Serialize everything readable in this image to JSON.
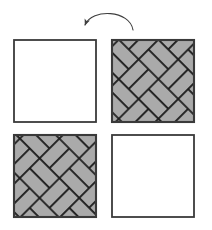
{
  "figure": {
    "canvas": {
      "width": 212,
      "height": 230,
      "background": "#ffffff"
    },
    "colors": {
      "outline": "#3a3a3a",
      "tile_fill": "#aaaaaa",
      "tile_outline": "#1a1a1a",
      "empty_fill": "#ffffff",
      "arrow": "#3f3f3f"
    },
    "arrow": {
      "name": "rotation-arrow",
      "direction": "counterclockwise",
      "label": "",
      "start_x": 132,
      "start_y": 28,
      "end_x": 84,
      "end_y": 26,
      "arrowhead_at": "left-end"
    },
    "squares": [
      {
        "id": "top-left",
        "name": "square-top-left-empty",
        "filled": false,
        "pattern": "none",
        "x": 14,
        "y": 40,
        "size": 82,
        "label": ""
      },
      {
        "id": "top-right",
        "name": "square-top-right-patterned",
        "filled": true,
        "pattern": "diagonal-basketweave",
        "x": 112,
        "y": 40,
        "size": 82,
        "label": ""
      },
      {
        "id": "bottom-left",
        "name": "square-bottom-left-patterned",
        "filled": true,
        "pattern": "diagonal-basketweave",
        "x": 14,
        "y": 135,
        "size": 82,
        "label": ""
      },
      {
        "id": "bottom-right",
        "name": "square-bottom-right-empty",
        "filled": false,
        "pattern": "none",
        "x": 112,
        "y": 135,
        "size": 82,
        "label": ""
      }
    ],
    "pattern_spec": {
      "name": "diagonal-basketweave",
      "brick_length": 28,
      "brick_width": 14,
      "rotation_deg": 45,
      "description": "Interlocking rectangular tiles laid at 45 degrees in a basketweave arrangement"
    }
  }
}
